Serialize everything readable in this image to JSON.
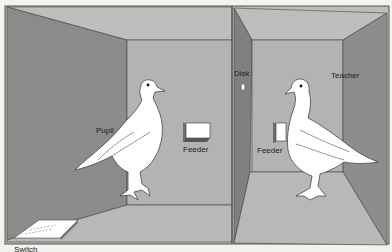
{
  "figure": {
    "labels": {
      "pupil": "Pupil",
      "feeder_left": "Feeder",
      "disk": "Disk",
      "teacher": "Teacher",
      "feeder_right": "Feeder",
      "switch": "Switch"
    },
    "colors": {
      "background": "#f2f2ef",
      "side_wall": "#8c8c8a",
      "back_wall": "#b4b4b2",
      "ceiling": "#bdbdbb",
      "floor": "#b9b9b7",
      "partition_face": "#7f7f7d",
      "edge": "#3a3a3a",
      "bird": "#ffffff"
    }
  }
}
